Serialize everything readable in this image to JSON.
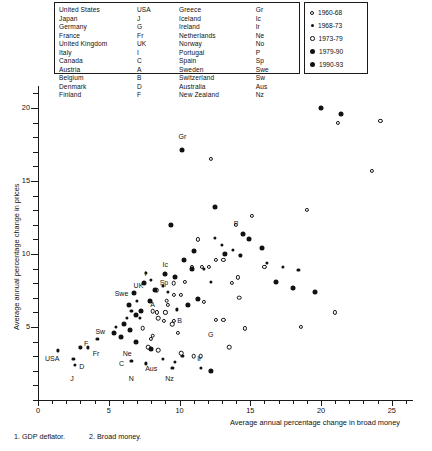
{
  "country_key": {
    "column1": [
      {
        "name": "United States",
        "abbr": "USA"
      },
      {
        "name": "Japan",
        "abbr": "J"
      },
      {
        "name": "Germany",
        "abbr": "G"
      },
      {
        "name": "France",
        "abbr": "Fr"
      },
      {
        "name": "United Kingdom",
        "abbr": "UK"
      },
      {
        "name": "Italy",
        "abbr": "I"
      },
      {
        "name": "Canada",
        "abbr": "C"
      },
      {
        "name": "Austria",
        "abbr": "A"
      },
      {
        "name": "Belgium",
        "abbr": "B"
      },
      {
        "name": "Denmark",
        "abbr": "D"
      },
      {
        "name": "Finland",
        "abbr": "F"
      }
    ],
    "column2": [
      {
        "name": "Greece",
        "abbr": "Gr"
      },
      {
        "name": "Iceland",
        "abbr": "Ic"
      },
      {
        "name": "Ireland",
        "abbr": "Ir"
      },
      {
        "name": "Netherlands",
        "abbr": "Ne"
      },
      {
        "name": "Norway",
        "abbr": "No"
      },
      {
        "name": "Portugal",
        "abbr": "P"
      },
      {
        "name": "Spain",
        "abbr": "Sp"
      },
      {
        "name": "Sweden",
        "abbr": "Swe"
      },
      {
        "name": "Switzerland",
        "abbr": "Sw"
      },
      {
        "name": "Australia",
        "abbr": "Aus"
      },
      {
        "name": "New Zealand",
        "abbr": "Nz"
      }
    ]
  },
  "footnotes": {
    "note1": "1.  GDP deflator.",
    "note2": "2.  Broad money."
  },
  "chart_data": {
    "type": "scatter",
    "title": "",
    "xlabel": "Average annual percentage change in broad money",
    "ylabel": "Average annual percentage change in prices",
    "xlim": [
      0,
      26.5
    ],
    "ylim": [
      0,
      21.5
    ],
    "xticks": [
      0,
      5,
      10,
      15,
      20,
      25
    ],
    "yticks": [
      5,
      10,
      15,
      20
    ],
    "xtick_labels": [
      "0",
      "5",
      "10",
      "15",
      "20",
      "25"
    ],
    "ytick_labels": [
      "5",
      "10",
      "15",
      "20"
    ],
    "grid": false,
    "legend_position": "top-right",
    "legend": [
      {
        "label": "1960-68",
        "marker": "open-small"
      },
      {
        "label": "1968-73",
        "marker": "filled-small"
      },
      {
        "label": "1973-79",
        "marker": "open-medium"
      },
      {
        "label": "1979-90",
        "marker": "filled-medium"
      },
      {
        "label": "1990-93",
        "marker": "filled-large"
      }
    ],
    "series": [
      {
        "name": "1960-68",
        "marker": "open-small",
        "points": [
          {
            "x": 12.2,
            "y": 16.5
          },
          {
            "x": 15.1,
            "y": 12.6
          },
          {
            "x": 14.0,
            "y": 12.0
          },
          {
            "x": 11.3,
            "y": 11.0
          },
          {
            "x": 19.0,
            "y": 13.0
          },
          {
            "x": 21.2,
            "y": 19.0
          },
          {
            "x": 24.2,
            "y": 19.1
          },
          {
            "x": 23.6,
            "y": 15.7
          },
          {
            "x": 12.6,
            "y": 9.6
          },
          {
            "x": 13.1,
            "y": 9.6
          },
          {
            "x": 16.0,
            "y": 9.1
          },
          {
            "x": 10.9,
            "y": 9.1
          },
          {
            "x": 11.6,
            "y": 9.1
          },
          {
            "x": 12.1,
            "y": 9.1
          },
          {
            "x": 14.1,
            "y": 8.4
          },
          {
            "x": 13.7,
            "y": 8.0
          },
          {
            "x": 10.4,
            "y": 8.1
          },
          {
            "x": 10.1,
            "y": 7.2
          },
          {
            "x": 9.6,
            "y": 7.2
          },
          {
            "x": 9.2,
            "y": 6.5
          },
          {
            "x": 9.0,
            "y": 6.0
          },
          {
            "x": 8.4,
            "y": 6.0
          },
          {
            "x": 8.9,
            "y": 5.4
          },
          {
            "x": 9.6,
            "y": 5.4
          },
          {
            "x": 12.6,
            "y": 5.5
          },
          {
            "x": 13.1,
            "y": 5.5
          },
          {
            "x": 14.6,
            "y": 4.9
          },
          {
            "x": 18.6,
            "y": 5.0
          },
          {
            "x": 21.0,
            "y": 6.0
          },
          {
            "x": 11.7,
            "y": 6.7
          },
          {
            "x": 9.9,
            "y": 4.6
          },
          {
            "x": 8.0,
            "y": 4.2
          }
        ]
      },
      {
        "name": "1968-73",
        "marker": "filled-small",
        "points": [
          {
            "x": 12.5,
            "y": 11.1
          },
          {
            "x": 13.0,
            "y": 10.6
          },
          {
            "x": 13.8,
            "y": 10.3
          },
          {
            "x": 14.3,
            "y": 9.9
          },
          {
            "x": 11.7,
            "y": 9.0
          },
          {
            "x": 12.2,
            "y": 8.1
          },
          {
            "x": 16.2,
            "y": 9.4
          },
          {
            "x": 17.3,
            "y": 9.1
          },
          {
            "x": 18.4,
            "y": 8.9
          },
          {
            "x": 7.6,
            "y": 8.7
          },
          {
            "x": 8.0,
            "y": 8.2
          },
          {
            "x": 8.8,
            "y": 7.8
          },
          {
            "x": 9.2,
            "y": 7.4
          },
          {
            "x": 7.0,
            "y": 6.8
          },
          {
            "x": 6.6,
            "y": 6.1
          },
          {
            "x": 6.3,
            "y": 5.6
          },
          {
            "x": 7.2,
            "y": 5.6
          },
          {
            "x": 9.8,
            "y": 6.2
          },
          {
            "x": 5.5,
            "y": 5.0
          },
          {
            "x": 4.2,
            "y": 4.2
          },
          {
            "x": 3.5,
            "y": 3.6
          },
          {
            "x": 3.0,
            "y": 3.6
          },
          {
            "x": 1.4,
            "y": 3.4
          },
          {
            "x": 2.5,
            "y": 2.8
          },
          {
            "x": 2.6,
            "y": 2.4
          },
          {
            "x": 6.6,
            "y": 2.7
          },
          {
            "x": 7.6,
            "y": 2.5
          },
          {
            "x": 8.8,
            "y": 2.8
          },
          {
            "x": 9.7,
            "y": 2.6
          },
          {
            "x": 9.5,
            "y": 2.2
          },
          {
            "x": 11.5,
            "y": 2.2
          },
          {
            "x": 10.2,
            "y": 3.0
          }
        ]
      },
      {
        "name": "1973-79",
        "marker": "open-medium",
        "points": [
          {
            "x": 9.6,
            "y": 8.0
          },
          {
            "x": 8.4,
            "y": 7.5
          },
          {
            "x": 9.1,
            "y": 6.8
          },
          {
            "x": 8.1,
            "y": 6.1
          },
          {
            "x": 8.5,
            "y": 5.6
          },
          {
            "x": 9.5,
            "y": 5.2
          },
          {
            "x": 7.4,
            "y": 4.9
          },
          {
            "x": 8.1,
            "y": 4.4
          },
          {
            "x": 7.8,
            "y": 3.6
          },
          {
            "x": 8.5,
            "y": 3.4
          },
          {
            "x": 10.1,
            "y": 3.2
          },
          {
            "x": 11.0,
            "y": 3.0
          },
          {
            "x": 11.5,
            "y": 3.0
          },
          {
            "x": 13.5,
            "y": 3.6
          },
          {
            "x": 14.2,
            "y": 7.0
          }
        ]
      },
      {
        "name": "1979-90",
        "marker": "filled-medium",
        "points": [
          {
            "x": 10.2,
            "y": 17.1
          },
          {
            "x": 14.5,
            "y": 11.4
          },
          {
            "x": 14.9,
            "y": 11.0
          },
          {
            "x": 15.8,
            "y": 10.4
          },
          {
            "x": 12.5,
            "y": 13.2
          },
          {
            "x": 11.0,
            "y": 10.2
          },
          {
            "x": 10.3,
            "y": 9.6
          },
          {
            "x": 10.9,
            "y": 9.0
          },
          {
            "x": 9.0,
            "y": 8.6
          },
          {
            "x": 9.7,
            "y": 8.4
          },
          {
            "x": 7.5,
            "y": 8.0
          },
          {
            "x": 8.3,
            "y": 7.5
          },
          {
            "x": 6.8,
            "y": 7.3
          },
          {
            "x": 7.9,
            "y": 6.8
          },
          {
            "x": 6.4,
            "y": 6.5
          },
          {
            "x": 7.3,
            "y": 6.1
          },
          {
            "x": 6.9,
            "y": 5.8
          },
          {
            "x": 6.1,
            "y": 5.2
          },
          {
            "x": 6.5,
            "y": 4.8
          },
          {
            "x": 5.4,
            "y": 4.6
          },
          {
            "x": 5.9,
            "y": 4.3
          },
          {
            "x": 6.9,
            "y": 4.0
          },
          {
            "x": 8.0,
            "y": 3.5
          },
          {
            "x": 16.8,
            "y": 8.1
          },
          {
            "x": 18.0,
            "y": 7.7
          },
          {
            "x": 19.6,
            "y": 7.4
          },
          {
            "x": 21.4,
            "y": 19.6
          },
          {
            "x": 20.0,
            "y": 20.0
          }
        ]
      },
      {
        "name": "1990-93",
        "marker": "filled-large",
        "points": [
          {
            "x": 9.4,
            "y": 12.0
          },
          {
            "x": 13.2,
            "y": 10.0
          },
          {
            "x": 12.2,
            "y": 2.0
          },
          {
            "x": 11.3,
            "y": 6.9
          },
          {
            "x": 10.6,
            "y": 6.5
          }
        ]
      }
    ],
    "point_labels": [
      {
        "text": "Gr",
        "x": 10.2,
        "y": 18.1
      },
      {
        "text": "P",
        "x": 14.0,
        "y": 12.1
      },
      {
        "text": "Ic",
        "x": 9.0,
        "y": 9.3
      },
      {
        "text": "Sp",
        "x": 8.9,
        "y": 8.1
      },
      {
        "text": "I",
        "x": 7.6,
        "y": 8.7
      },
      {
        "text": "UK",
        "x": 7.1,
        "y": 7.9
      },
      {
        "text": "Swe",
        "x": 5.9,
        "y": 7.3
      },
      {
        "text": "A",
        "x": 8.1,
        "y": 6.6
      },
      {
        "text": "B",
        "x": 10.0,
        "y": 5.5
      },
      {
        "text": "G",
        "x": 12.2,
        "y": 4.5
      },
      {
        "text": "Sw",
        "x": 4.4,
        "y": 4.7
      },
      {
        "text": "F",
        "x": 3.4,
        "y": 3.9
      },
      {
        "text": "Fr",
        "x": 4.1,
        "y": 3.2
      },
      {
        "text": "USA",
        "x": 1.0,
        "y": 2.9
      },
      {
        "text": "D",
        "x": 3.1,
        "y": 2.3
      },
      {
        "text": "J",
        "x": 2.4,
        "y": 1.5
      },
      {
        "text": "Ne",
        "x": 6.3,
        "y": 3.2
      },
      {
        "text": "C",
        "x": 5.9,
        "y": 2.5
      },
      {
        "text": "Aus",
        "x": 8.0,
        "y": 2.2
      },
      {
        "text": "N",
        "x": 6.6,
        "y": 1.5
      },
      {
        "text": "Nz",
        "x": 9.3,
        "y": 1.5
      },
      {
        "text": "Ir",
        "x": 11.4,
        "y": 2.9
      }
    ]
  }
}
